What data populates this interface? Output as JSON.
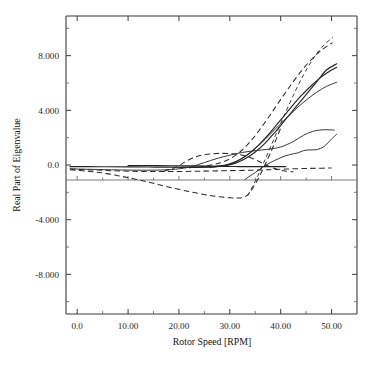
{
  "chart_data": {
    "type": "line",
    "title": "",
    "xlabel": "Rotor Speed [RPM]",
    "ylabel": "Real Part of Eigenvalue",
    "xlim": [
      -2.2,
      55.0
    ],
    "ylim": [
      -10.9,
      10.9
    ],
    "xticks": [
      0,
      10,
      20,
      30,
      40,
      50
    ],
    "xtick_labels": [
      "0.0",
      "10.00",
      "20.00",
      "30.00",
      "40.00",
      "50.00"
    ],
    "yticks": [
      8,
      4,
      0,
      -4,
      -8
    ],
    "ytick_labels": [
      "8.000",
      "4.000",
      "0.0",
      "-4.000",
      "-8.000"
    ],
    "grid": false,
    "legend": "none",
    "zero_reference_line": true,
    "series": [
      {
        "name": "branch-1-solid-steep",
        "style": "solid",
        "x": [
          -1.4,
          2.0,
          6.0,
          10.0,
          14.0,
          18.0,
          21.0,
          24.0,
          27.0,
          29.0,
          31.0,
          33.0,
          35.0,
          37.0,
          39.0,
          41.0,
          43.0,
          45.0,
          47.0,
          49.0,
          51.0
        ],
        "y": [
          -0.12,
          -0.12,
          -0.13,
          -0.14,
          -0.15,
          -0.16,
          -0.16,
          -0.15,
          -0.12,
          -0.05,
          0.12,
          0.45,
          0.95,
          1.62,
          2.45,
          3.35,
          4.25,
          5.15,
          6.05,
          6.95,
          7.4
        ]
      },
      {
        "name": "branch-2-solid-steep-upper",
        "style": "solid",
        "x": [
          20.0,
          23.0,
          26.0,
          28.0,
          30.0,
          32.0,
          34.0,
          36.0,
          38.0,
          40.0,
          42.0,
          44.0,
          46.0,
          48.0,
          50.0,
          51.0
        ],
        "y": [
          -0.18,
          -0.18,
          -0.15,
          -0.08,
          0.08,
          0.4,
          0.9,
          1.58,
          2.4,
          3.3,
          4.2,
          5.05,
          5.8,
          6.45,
          6.95,
          7.15
        ]
      },
      {
        "name": "branch-3-dashed-steepest",
        "style": "dashed",
        "x": [
          22.0,
          25.0,
          28.0,
          30.0,
          32.0,
          34.0,
          36.0,
          38.0,
          40.0,
          42.0,
          44.0,
          46.0,
          48.0,
          50.2
        ],
        "y": [
          -0.2,
          -0.1,
          0.15,
          0.45,
          0.95,
          1.7,
          2.65,
          3.7,
          4.8,
          5.85,
          6.85,
          7.7,
          8.4,
          8.95
        ]
      },
      {
        "name": "branch-4-solid-mid",
        "style": "solid-thin",
        "x": [
          26.0,
          29.0,
          31.0,
          33.0,
          35.0,
          37.0,
          39.0,
          41.0,
          43.0,
          45.0,
          47.0,
          49.0,
          51.0
        ],
        "y": [
          -0.18,
          -0.05,
          0.2,
          0.62,
          1.2,
          1.9,
          2.65,
          3.4,
          4.1,
          4.75,
          5.3,
          5.75,
          6.05
        ]
      },
      {
        "name": "branch-5-dashed-deep-well",
        "style": "dashed",
        "x": [
          -1.4,
          2.0,
          5.0,
          8.0,
          11.0,
          14.0,
          17.0,
          20.0,
          23.0,
          26.0,
          28.0,
          30.0,
          31.5,
          32.5,
          33.5,
          34.5,
          36.0,
          38.0,
          40.0
        ],
        "y": [
          -0.35,
          -0.45,
          -0.58,
          -0.78,
          -1.0,
          -1.25,
          -1.52,
          -1.78,
          -2.02,
          -2.22,
          -2.33,
          -2.4,
          -2.42,
          -2.38,
          -2.18,
          -1.7,
          -0.7,
          0.9,
          2.7
        ]
      },
      {
        "name": "branch-6-dashed-steep-from-well",
        "style": "dashed-fine",
        "x": [
          33.5,
          34.5,
          35.5,
          37.0,
          38.5,
          40.0,
          41.5,
          43.0,
          44.5,
          46.0,
          47.5,
          49.0,
          50.3
        ],
        "y": [
          -2.25,
          -1.55,
          -0.8,
          0.45,
          1.75,
          3.05,
          4.3,
          5.5,
          6.6,
          7.55,
          8.35,
          8.95,
          9.35
        ]
      },
      {
        "name": "branch-7-solid-plateau-upper",
        "style": "solid-thin",
        "x": [
          -1.4,
          3.0,
          8.0,
          13.0,
          17.0,
          20.0,
          22.5,
          25.0,
          27.5,
          30.0,
          32.5,
          35.0,
          37.5,
          40.0,
          42.5,
          44.5,
          46.5,
          48.5,
          50.5
        ],
        "y": [
          -0.28,
          -0.32,
          -0.36,
          -0.38,
          -0.36,
          -0.28,
          -0.12,
          0.18,
          0.48,
          0.72,
          0.92,
          1.05,
          1.15,
          1.32,
          1.72,
          2.18,
          2.48,
          2.58,
          2.55
        ]
      },
      {
        "name": "branch-8-solid-lower-loop",
        "style": "solid-thin",
        "x": [
          33.0,
          35.0,
          36.5,
          38.0,
          39.5,
          41.0,
          42.5,
          43.5,
          44.5,
          45.5,
          47.0,
          48.5,
          50.0,
          51.0
        ],
        "y": [
          -1.05,
          -0.55,
          -0.15,
          0.18,
          0.45,
          0.68,
          0.82,
          0.9,
          1.05,
          1.1,
          1.12,
          1.35,
          1.9,
          2.25
        ]
      },
      {
        "name": "branch-9-dashed-flat-near-zero",
        "style": "dashed",
        "x": [
          -1.4,
          3.0,
          7.0,
          11.0,
          15.0,
          19.0,
          23.0,
          26.0,
          29.0,
          32.0,
          35.0,
          38.0,
          41.0,
          44.0,
          47.0,
          50.0
        ],
        "y": [
          -0.3,
          -0.36,
          -0.42,
          -0.46,
          -0.48,
          -0.48,
          -0.46,
          -0.44,
          -0.42,
          -0.4,
          -0.38,
          -0.34,
          -0.3,
          -0.26,
          -0.24,
          -0.22
        ]
      },
      {
        "name": "branch-10-dashed-hump",
        "style": "dashed",
        "x": [
          17.0,
          19.5,
          21.5,
          23.5,
          25.5,
          28.0,
          30.5,
          32.5,
          34.5,
          36.5,
          38.5,
          40.5,
          42.5
        ],
        "y": [
          -0.45,
          -0.15,
          0.3,
          0.62,
          0.78,
          0.85,
          0.82,
          0.72,
          0.48,
          0.12,
          -0.22,
          -0.42,
          -0.5
        ]
      },
      {
        "name": "branch-11-solid-zero-baseline",
        "style": "solid",
        "x": [
          10.0,
          16.0,
          22.0,
          26.0,
          29.0,
          31.0,
          33.0,
          35.0,
          37.0,
          39.0,
          41.0
        ],
        "y": [
          -0.05,
          -0.05,
          -0.06,
          -0.08,
          -0.1,
          -0.11,
          -0.12,
          -0.12,
          -0.12,
          -0.12,
          -0.12
        ]
      }
    ]
  }
}
